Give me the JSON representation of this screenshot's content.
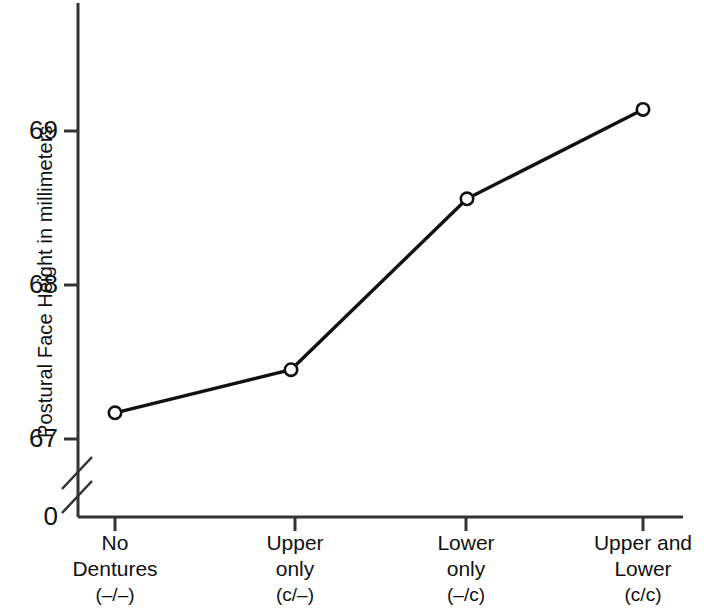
{
  "chart_data": {
    "type": "line",
    "title": "",
    "subtitle": "",
    "xlabel": "",
    "ylabel": "Postural Face Height in millimeters",
    "categories": [
      "No Dentures (–/–)",
      "Upper only (c/–)",
      "Lower only (–/c)",
      "Upper and Lower (c/c)"
    ],
    "values": [
      67.17,
      67.45,
      68.56,
      69.14
    ],
    "series": [
      {
        "name": "Postural Face Height",
        "values": [
          67.17,
          67.45,
          68.56,
          69.14
        ]
      }
    ],
    "ylim": [
      66.9,
      69.4
    ],
    "y_ticks": [
      67,
      68,
      69
    ],
    "y_tick_labels": [
      "67",
      "68",
      "69"
    ],
    "origin_label": "0",
    "axis_break": true,
    "grid": false,
    "legend": "none",
    "marker": "open-circle",
    "line_color": "#111111",
    "marker_fill": "#ffffff",
    "marker_stroke": "#111111",
    "axis_color": "#333333"
  },
  "axes": {
    "y_title": "Postural Face Height in millimeters",
    "y_tick_labels": [
      "69",
      "68",
      "67"
    ],
    "origin_label": "0"
  },
  "x_categories": [
    {
      "line1": "No",
      "line2": "Dentures",
      "line3": "(–/–)"
    },
    {
      "line1": "Upper",
      "line2": "only",
      "line3": "(c/–)"
    },
    {
      "line1": "Lower",
      "line2": "only",
      "line3": "(–/c)"
    },
    {
      "line1": "Upper and",
      "line2": "Lower",
      "line3": "(c/c)"
    }
  ]
}
